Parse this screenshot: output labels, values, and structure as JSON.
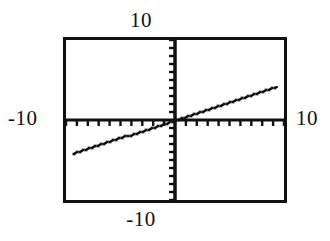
{
  "figure": {
    "background_color": "#ffffff",
    "ink_color": "#111111",
    "labels": {
      "y_max": "10",
      "y_min": "-10",
      "x_min": "-10",
      "x_max": "10"
    }
  },
  "chart_data": {
    "type": "line",
    "title": "",
    "subtitle": "",
    "xlabel": "",
    "ylabel": "",
    "xlim": [
      -10,
      10
    ],
    "ylim": [
      -10,
      10
    ],
    "grid": false,
    "legend": null,
    "axes_style": "calculator-crosshair",
    "x_tick_labels": [
      "-10",
      "10"
    ],
    "y_tick_labels": [
      "-10",
      "10"
    ],
    "x_tick_interval": 1,
    "y_tick_interval": 1,
    "x_tick_count": 20,
    "y_tick_count": 20,
    "tick_direction": {
      "x_axis": "down",
      "y_axis": "left"
    },
    "series": [
      {
        "name": "y = 0.45x",
        "style": "solid-pixelated",
        "slope": 0.45,
        "intercept": 0,
        "x": [
          -9.4,
          -7.0,
          -4.5,
          -2.0,
          0.0,
          2.0,
          4.5,
          7.0,
          9.5
        ],
        "y": [
          -4.25,
          -3.15,
          -2.05,
          -0.9,
          0.0,
          0.9,
          2.05,
          3.15,
          4.28
        ]
      }
    ],
    "annotations": []
  }
}
